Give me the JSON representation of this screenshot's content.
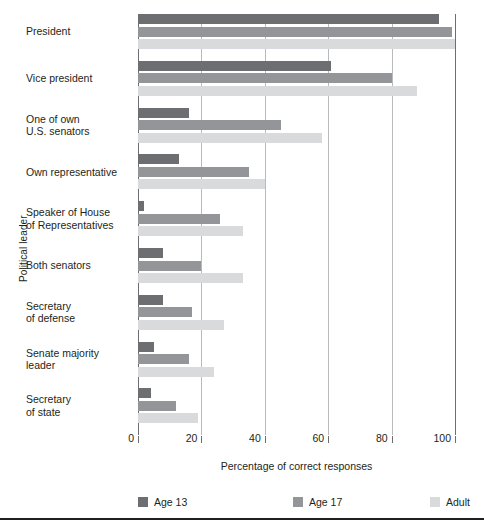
{
  "chart_data": {
    "type": "bar",
    "orientation": "horizontal",
    "title": "",
    "xlabel": "Percentage of correct responses",
    "ylabel": "Political leader",
    "xlim": [
      0,
      100
    ],
    "xticks": [
      0,
      20,
      40,
      60,
      80,
      100
    ],
    "grid": true,
    "grid_axis": "x",
    "legend_position": "bottom",
    "categories": [
      "President",
      "Vice president",
      "One of own\nU.S. senators",
      "Own representative",
      "Speaker of House\nof Representatives",
      "Both senators",
      "Secretary\nof defense",
      "Senate majority\nleader",
      "Secretary\nof state"
    ],
    "series": [
      {
        "name": "Age 13",
        "color": "#6d6e71",
        "values": [
          95,
          61,
          16,
          13,
          2,
          8,
          8,
          5,
          4
        ]
      },
      {
        "name": "Age 17",
        "color": "#939598",
        "values": [
          99,
          80,
          45,
          35,
          26,
          20,
          17,
          16,
          12
        ]
      },
      {
        "name": "Adult",
        "color": "#d9dadb",
        "values": [
          100,
          88,
          58,
          40,
          33,
          33,
          27,
          24,
          19
        ]
      }
    ]
  },
  "axis": {
    "x_tick_labels": [
      "0",
      "20",
      "40",
      "60",
      "80",
      "100"
    ],
    "x_title": "Percentage of correct responses",
    "y_title": "Political leader"
  },
  "legend": {
    "items": [
      {
        "label": "Age 13",
        "color": "#6d6e71"
      },
      {
        "label": "Age 17",
        "color": "#939598"
      },
      {
        "label": "Adult",
        "color": "#d9dadb"
      }
    ]
  }
}
